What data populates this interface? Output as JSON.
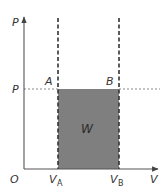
{
  "diagram": {
    "type": "pressure-volume diagram",
    "colors": {
      "axis": "#555555",
      "work_area": "#7f7f7f",
      "dashed_lines": "#333333",
      "pressure_guide": "#888888",
      "text": "#333333"
    },
    "axes": {
      "y_label": "P",
      "x_label": "V",
      "origin_label": "O"
    },
    "levels": {
      "pressure_label": "P"
    },
    "points": {
      "a": {
        "label": "A"
      },
      "b": {
        "label": "B"
      }
    },
    "volumes": {
      "va": {
        "main": "V",
        "sub": "A"
      },
      "vb": {
        "main": "V",
        "sub": "B"
      }
    },
    "area": {
      "label": "W"
    }
  }
}
